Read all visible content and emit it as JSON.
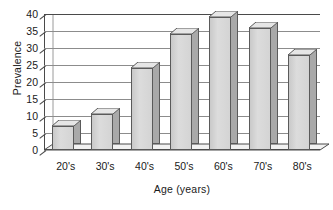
{
  "chart_data": {
    "type": "bar",
    "title": "",
    "subtitle": "",
    "xlabel": "Age (years)",
    "ylabel": "Prevalence",
    "categories": [
      "20's",
      "30's",
      "40's",
      "50's",
      "60's",
      "70's",
      "80's"
    ],
    "values": [
      7,
      10.5,
      24,
      34,
      39,
      36,
      28
    ],
    "series": [
      {
        "name": "Prevalence",
        "values": [
          7,
          10.5,
          24,
          34,
          39,
          36,
          28
        ]
      }
    ],
    "ylim": [
      0,
      40
    ],
    "y_ticks": [
      0,
      5,
      10,
      15,
      20,
      25,
      30,
      35,
      40
    ],
    "y_tick_labels": [
      "0",
      "5",
      "10",
      "15",
      "20",
      "25",
      "30",
      "35",
      "40"
    ],
    "grid": true,
    "grid_axis": "y",
    "legend": false,
    "legend_position": "none",
    "style": "3d-bar",
    "annotations": [],
    "colors": {
      "bar_front": "#d2d2d2",
      "bar_side": "#a9a9a9",
      "bar_top": "#e6e6e6",
      "bar_outline": "#5a5a5a",
      "gridline": "#8c8c8c",
      "axis": "#4a4a4a",
      "text": "#1a1a1a",
      "background": "#ffffff"
    }
  }
}
